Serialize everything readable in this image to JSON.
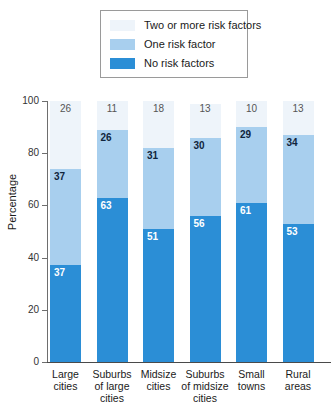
{
  "chart_data": {
    "type": "bar",
    "subtype": "stacked-bar-100",
    "title": "",
    "xlabel": "",
    "ylabel": "Percentage",
    "ylim": [
      0,
      100
    ],
    "yticks": [
      0,
      20,
      40,
      60,
      80,
      100
    ],
    "grid": false,
    "legend_position": "top-center",
    "categories": [
      "Large cities",
      "Suburbs of large cities",
      "Midsize cities",
      "Suburbs of midsize cities",
      "Small towns",
      "Rural areas"
    ],
    "category_lines": [
      [
        "Large",
        "cities"
      ],
      [
        "Suburbs",
        "of large",
        "cities"
      ],
      [
        "Midsize",
        "cities"
      ],
      [
        "Suburbs",
        "of midsize",
        "cities"
      ],
      [
        "Small",
        "towns"
      ],
      [
        "Rural",
        "areas"
      ]
    ],
    "series": [
      {
        "name": "No risk factors",
        "color": "#2b8ed6",
        "values": [
          37,
          63,
          51,
          56,
          61,
          53
        ]
      },
      {
        "name": "One risk factor",
        "color": "#a8cfee",
        "values": [
          37,
          26,
          31,
          30,
          29,
          34
        ]
      },
      {
        "name": "Two or more risk factors",
        "color": "#eef4fa",
        "values": [
          26,
          11,
          18,
          13,
          10,
          13
        ]
      }
    ]
  },
  "legend": {
    "items": [
      {
        "label": "Two or more risk factors",
        "color": "#eef4fa"
      },
      {
        "label": "One risk factor",
        "color": "#a8cfee"
      },
      {
        "label": "No risk factors",
        "color": "#2b8ed6"
      }
    ]
  },
  "axis": {
    "y_title": "Percentage",
    "y_tick_labels": [
      "100",
      "80",
      "60",
      "40",
      "20",
      "0"
    ]
  }
}
